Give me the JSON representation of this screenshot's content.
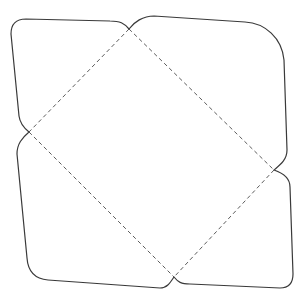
{
  "diagram": {
    "type": "envelope-template",
    "colors": {
      "background": "#ffffff",
      "cut_line": "#3a3a3a",
      "fold_line": "#4a4a4a"
    },
    "fold_vertices": {
      "top": [
        129,
        29
      ],
      "left": [
        29,
        132
      ],
      "right": [
        274,
        170
      ],
      "bottom": [
        174,
        277
      ]
    },
    "flaps": [
      "top-left",
      "top-right",
      "bottom-left",
      "bottom-right"
    ],
    "line_styles": {
      "cut": "solid",
      "fold": "dashed"
    }
  }
}
